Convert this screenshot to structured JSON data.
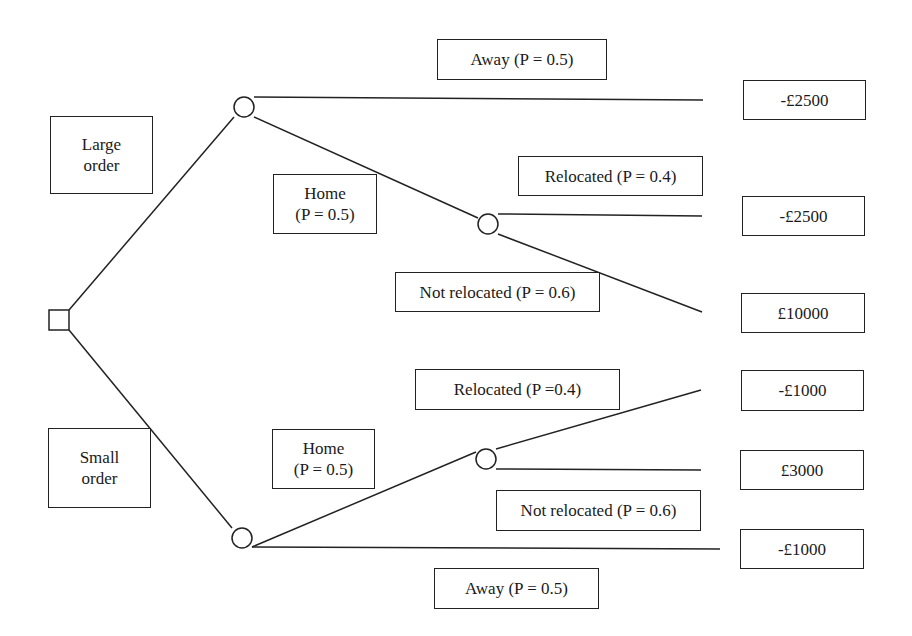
{
  "diagram": {
    "type": "decision-tree",
    "decisions": {
      "large_order": [
        "Large",
        "order"
      ],
      "small_order": [
        "Small",
        "order"
      ]
    },
    "large_branch": {
      "away": "Away (P = 0.5)",
      "home": [
        "Home",
        "(P = 0.5)"
      ],
      "relocated": "Relocated (P = 0.4)",
      "not_relocated": "Not relocated (P = 0.6)"
    },
    "small_branch": {
      "relocated": "Relocated (P =0.4)",
      "home": [
        "Home",
        "(P = 0.5)"
      ],
      "not_relocated": "Not relocated (P = 0.6)",
      "away": "Away (P = 0.5)"
    },
    "payoffs": [
      "-£2500",
      "-£2500",
      "£10000",
      "-£1000",
      "£3000",
      "-£1000"
    ]
  }
}
